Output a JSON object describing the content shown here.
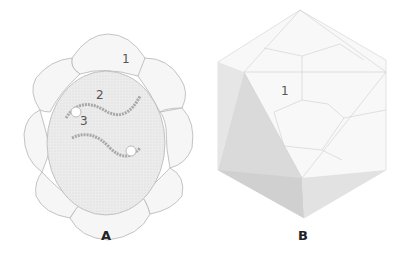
{
  "figure_a": {
    "caption": "A",
    "labels": {
      "one": "1",
      "two": "2",
      "three": "3"
    }
  },
  "figure_b": {
    "caption": "B",
    "labels": {
      "one": "1"
    }
  }
}
